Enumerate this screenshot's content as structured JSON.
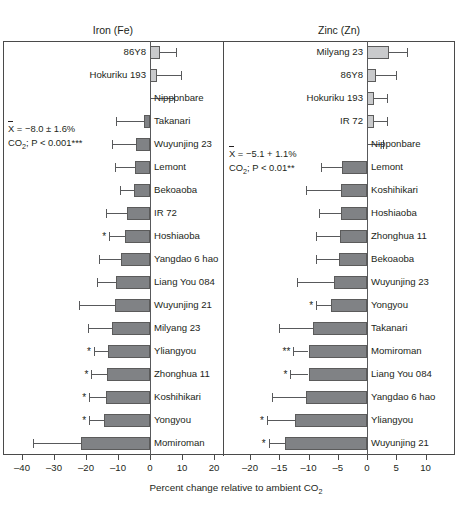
{
  "figure": {
    "axis_title_prefix": "Percent change relative to ambient CO",
    "axis_title_sub": "2"
  },
  "panels": [
    {
      "id": "fe",
      "title": "Iron (Fe)",
      "stats_line1_prefix": "X",
      "stats_line1": " = −8.0 ± 1.6%",
      "stats_line2_prefix": "CO",
      "stats_line2_sub": "2",
      "stats_line2": "; P < 0.001***",
      "xmin": -40,
      "xmax": 25,
      "ticks": [
        -40,
        -30,
        -20,
        -10,
        0,
        10,
        20
      ],
      "tick_labels": [
        "–40",
        "–30",
        "–20",
        "–10",
        "0",
        "10",
        "20"
      ],
      "rows": [
        {
          "label": "86Y8",
          "value": 3.0,
          "err": 5.0,
          "sig": ""
        },
        {
          "label": "Hokuriku 193",
          "value": 2.3,
          "err": 7.3,
          "sig": ""
        },
        {
          "label": "Nipponbare",
          "value": 0.0,
          "err": 7.5,
          "sig": ""
        },
        {
          "label": "Takanari",
          "value": -2.0,
          "err": 8.5,
          "sig": ""
        },
        {
          "label": "Wuyunjing 23",
          "value": -4.5,
          "err": 7.5,
          "sig": ""
        },
        {
          "label": "Lemont",
          "value": -4.8,
          "err": 6.0,
          "sig": ""
        },
        {
          "label": "Bekoaoba",
          "value": -5.0,
          "err": 4.5,
          "sig": ""
        },
        {
          "label": "IR 72",
          "value": -7.2,
          "err": 6.5,
          "sig": ""
        },
        {
          "label": "Hoshiaoba",
          "value": -7.8,
          "err": 5.0,
          "sig": "*"
        },
        {
          "label": "Yangdao 6 hao",
          "value": -9.0,
          "err": 7.0,
          "sig": ""
        },
        {
          "label": "Liang You 084",
          "value": -10.5,
          "err": 6.0,
          "sig": ""
        },
        {
          "label": "Wuyunjing 21",
          "value": -10.8,
          "err": 11.5,
          "sig": ""
        },
        {
          "label": "Milyang 23",
          "value": -11.8,
          "err": 7.5,
          "sig": ""
        },
        {
          "label": "Yliangyou",
          "value": -13.0,
          "err": 4.5,
          "sig": "*"
        },
        {
          "label": "Zhonghua 11",
          "value": -13.5,
          "err": 4.8,
          "sig": "*"
        },
        {
          "label": "Koshihikari",
          "value": -13.8,
          "err": 5.2,
          "sig": "*"
        },
        {
          "label": "Yongyou",
          "value": -14.5,
          "err": 4.5,
          "sig": "*"
        },
        {
          "label": "Momiroman",
          "value": -21.5,
          "err": 15.0,
          "sig": ""
        }
      ]
    },
    {
      "id": "zn",
      "title": "Zinc (Zn)",
      "stats_line1_prefix": "X",
      "stats_line1": " = −5.1 + 1.1%",
      "stats_line2_prefix": "CO",
      "stats_line2_sub": "2",
      "stats_line2": "; P < 0.01**",
      "xmin": -23,
      "xmax": 13,
      "ticks": [
        -20,
        -15,
        -10,
        -5,
        0,
        5,
        10
      ],
      "tick_labels": [
        "–20",
        "–15",
        "–10",
        "–5",
        "0",
        "5",
        "10"
      ],
      "rows": [
        {
          "label": "Milyang 23",
          "value": 3.7,
          "err": 3.1,
          "sig": ""
        },
        {
          "label": "86Y8",
          "value": 1.5,
          "err": 3.4,
          "sig": ""
        },
        {
          "label": "Hokuriku 193",
          "value": 1.2,
          "err": 2.3,
          "sig": ""
        },
        {
          "label": "IR 72",
          "value": 1.2,
          "err": 2.2,
          "sig": ""
        },
        {
          "label": "Nipponbare",
          "value": 0.0,
          "err": 2.8,
          "sig": ""
        },
        {
          "label": "Lemont",
          "value": -4.3,
          "err": 3.6,
          "sig": ""
        },
        {
          "label": "Koshihikari",
          "value": -4.4,
          "err": 6.0,
          "sig": ""
        },
        {
          "label": "Hoshiaoba",
          "value": -4.5,
          "err": 3.7,
          "sig": ""
        },
        {
          "label": "Zhonghua 11",
          "value": -4.6,
          "err": 4.2,
          "sig": ""
        },
        {
          "label": "Bekoaoba",
          "value": -4.8,
          "err": 4.0,
          "sig": ""
        },
        {
          "label": "Wuyunjing 23",
          "value": -5.7,
          "err": 6.2,
          "sig": ""
        },
        {
          "label": "Yongyou",
          "value": -6.2,
          "err": 2.5,
          "sig": "*"
        },
        {
          "label": "Takanari",
          "value": -9.3,
          "err": 5.8,
          "sig": ""
        },
        {
          "label": "Momiroman",
          "value": -10.0,
          "err": 2.6,
          "sig": "**"
        },
        {
          "label": "Liang You 084",
          "value": -10.0,
          "err": 3.1,
          "sig": "*"
        },
        {
          "label": "Yangdao 6 hao",
          "value": -10.5,
          "err": 5.8,
          "sig": ""
        },
        {
          "label": "Yliangyou",
          "value": -12.3,
          "err": 4.8,
          "sig": "*"
        },
        {
          "label": "Wuyunjing 21",
          "value": -14.0,
          "err": 2.8,
          "sig": "*"
        }
      ]
    }
  ],
  "chart_data": {
    "type": "bar",
    "orientation": "horizontal",
    "title": "",
    "xlabel": "Percent change relative to ambient CO2",
    "ylabel": "",
    "grid": false,
    "legend": "none",
    "panels": [
      {
        "name": "Iron (Fe)",
        "xlim": [
          -40,
          25
        ],
        "xticks": [
          -40,
          -30,
          -20,
          -10,
          0,
          10,
          20
        ],
        "mean": -8.0,
        "mean_se": 1.6,
        "p_text": "CO2; P < 0.001***",
        "categories": [
          "86Y8",
          "Hokuriku 193",
          "Nipponbare",
          "Takanari",
          "Wuyunjing 23",
          "Lemont",
          "Bekoaoba",
          "IR 72",
          "Hoshiaoba",
          "Yangdao 6 hao",
          "Liang You 084",
          "Wuyunjing 21",
          "Milyang 23",
          "Yliangyou",
          "Zhonghua 11",
          "Koshihikari",
          "Yongyou",
          "Momiroman"
        ],
        "values": [
          3.0,
          2.3,
          0.0,
          -2.0,
          -4.5,
          -4.8,
          -5.0,
          -7.2,
          -7.8,
          -9.0,
          -10.5,
          -10.8,
          -11.8,
          -13.0,
          -13.5,
          -13.8,
          -14.5,
          -21.5
        ],
        "errors": [
          5.0,
          7.3,
          7.5,
          8.5,
          7.5,
          6.0,
          4.5,
          6.5,
          5.0,
          7.0,
          6.0,
          11.5,
          7.5,
          4.5,
          4.8,
          5.2,
          4.5,
          15.0
        ],
        "significance": [
          "",
          "",
          "",
          "",
          "",
          "",
          "",
          "",
          "*",
          "",
          "",
          "",
          "",
          "*",
          "*",
          "*",
          "*",
          ""
        ]
      },
      {
        "name": "Zinc (Zn)",
        "xlim": [
          -23,
          13
        ],
        "xticks": [
          -20,
          -15,
          -10,
          -5,
          0,
          5,
          10
        ],
        "mean": -5.1,
        "mean_se": 1.1,
        "p_text": "CO2; P < 0.01**",
        "categories": [
          "Milyang 23",
          "86Y8",
          "Hokuriku 193",
          "IR 72",
          "Nipponbare",
          "Lemont",
          "Koshihikari",
          "Hoshiaoba",
          "Zhonghua 11",
          "Bekoaoba",
          "Wuyunjing 23",
          "Yongyou",
          "Takanari",
          "Momiroman",
          "Liang You 084",
          "Yangdao 6 hao",
          "Yliangyou",
          "Wuyunjing 21"
        ],
        "values": [
          3.7,
          1.5,
          1.2,
          1.2,
          0.0,
          -4.3,
          -4.4,
          -4.5,
          -4.6,
          -4.8,
          -5.7,
          -6.2,
          -9.3,
          -10.0,
          -10.0,
          -10.5,
          -12.3,
          -14.0
        ],
        "errors": [
          3.1,
          3.4,
          2.3,
          2.2,
          2.8,
          3.6,
          6.0,
          3.7,
          4.2,
          4.0,
          6.2,
          2.5,
          5.8,
          2.6,
          3.1,
          5.8,
          4.8,
          2.8
        ],
        "significance": [
          "",
          "",
          "",
          "",
          "",
          "",
          "",
          "",
          "",
          "",
          "",
          "*",
          "",
          "**",
          "*",
          "",
          "*",
          "*"
        ]
      }
    ]
  }
}
